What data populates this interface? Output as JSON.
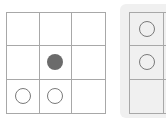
{
  "board": {
    "rows": 3,
    "cols": 3,
    "cells": [
      [
        "empty",
        "empty",
        "empty"
      ],
      [
        "empty",
        "filled",
        "empty"
      ],
      [
        "hollow",
        "hollow",
        "empty"
      ]
    ]
  },
  "side_panel": {
    "rows": 3,
    "visible_cols": 2,
    "cells": [
      [
        "hollow",
        "empty"
      ],
      [
        "hollow",
        "empty"
      ],
      [
        "empty",
        "empty"
      ]
    ]
  },
  "colors": {
    "grid_line": "#a8a8a8",
    "filled_piece": "#6b6b6b",
    "hollow_piece_outline": "#7a7a7a",
    "panel_background": "#f0f0f0"
  }
}
